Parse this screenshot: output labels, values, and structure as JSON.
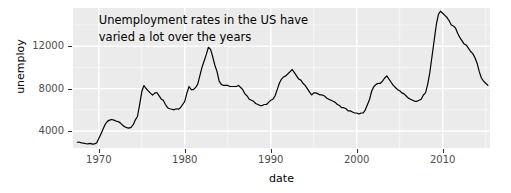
{
  "chart_data": {
    "type": "line",
    "title": "",
    "annotation": {
      "line1": "Unemployment rates in the US have",
      "line2": "varied a lot over the years",
      "x_value": 1970.0,
      "y_value": 14500
    },
    "xlabel": "date",
    "ylabel": "unemploy",
    "xlim": [
      1967.0,
      2015.5
    ],
    "ylim": [
      2400,
      15600
    ],
    "xticks": [
      1970,
      1980,
      1990,
      2000,
      2010
    ],
    "xticklabels": [
      "1970",
      "1980",
      "1990",
      "2000",
      "2010"
    ],
    "yticks": [
      4000,
      8000,
      12000
    ],
    "yticklabels": [
      "4000",
      "8000",
      "12000"
    ],
    "grid": true,
    "grid_major_color": "#ffffff",
    "grid_minor_color": "#ffffff",
    "panel_background": "#ebebeb",
    "line_color": "#000000",
    "line_width": 1.2,
    "legend": null,
    "series": [
      {
        "name": "unemploy",
        "x": [
          1967.5,
          1967.75,
          1968.0,
          1968.25,
          1968.5,
          1968.75,
          1969.0,
          1969.25,
          1969.5,
          1969.75,
          1970.0,
          1970.25,
          1970.5,
          1970.75,
          1971.0,
          1971.25,
          1971.5,
          1971.75,
          1972.0,
          1972.25,
          1972.5,
          1972.75,
          1973.0,
          1973.25,
          1973.5,
          1973.75,
          1974.0,
          1974.25,
          1974.5,
          1974.75,
          1975.0,
          1975.25,
          1975.5,
          1975.75,
          1976.0,
          1976.25,
          1976.5,
          1976.75,
          1977.0,
          1977.25,
          1977.5,
          1977.75,
          1978.0,
          1978.25,
          1978.5,
          1978.75,
          1979.0,
          1979.25,
          1979.5,
          1979.75,
          1980.0,
          1980.25,
          1980.5,
          1980.75,
          1981.0,
          1981.25,
          1981.5,
          1981.75,
          1982.0,
          1982.25,
          1982.5,
          1982.75,
          1983.0,
          1983.25,
          1983.5,
          1983.75,
          1984.0,
          1984.25,
          1984.5,
          1984.75,
          1985.0,
          1985.25,
          1985.5,
          1985.75,
          1986.0,
          1986.25,
          1986.5,
          1986.75,
          1987.0,
          1987.25,
          1987.5,
          1987.75,
          1988.0,
          1988.25,
          1988.5,
          1988.75,
          1989.0,
          1989.25,
          1989.5,
          1989.75,
          1990.0,
          1990.25,
          1990.5,
          1990.75,
          1991.0,
          1991.25,
          1991.5,
          1991.75,
          1992.0,
          1992.25,
          1992.5,
          1992.75,
          1993.0,
          1993.25,
          1993.5,
          1993.75,
          1994.0,
          1994.25,
          1994.5,
          1994.75,
          1995.0,
          1995.25,
          1995.5,
          1995.75,
          1996.0,
          1996.25,
          1996.5,
          1996.75,
          1997.0,
          1997.25,
          1997.5,
          1997.75,
          1998.0,
          1998.25,
          1998.5,
          1998.75,
          1999.0,
          1999.25,
          1999.5,
          1999.75,
          2000.0,
          2000.25,
          2000.5,
          2000.75,
          2001.0,
          2001.25,
          2001.5,
          2001.75,
          2002.0,
          2002.25,
          2002.5,
          2002.75,
          2003.0,
          2003.25,
          2003.5,
          2003.75,
          2004.0,
          2004.25,
          2004.5,
          2004.75,
          2005.0,
          2005.25,
          2005.5,
          2005.75,
          2006.0,
          2006.25,
          2006.5,
          2006.75,
          2007.0,
          2007.25,
          2007.5,
          2007.75,
          2008.0,
          2008.25,
          2008.5,
          2008.75,
          2009.0,
          2009.25,
          2009.5,
          2009.75,
          2010.0,
          2010.25,
          2010.5,
          2010.75,
          2011.0,
          2011.25,
          2011.5,
          2011.75,
          2012.0,
          2012.25,
          2012.5,
          2012.75,
          2013.0,
          2013.25,
          2013.5,
          2013.75,
          2014.0,
          2014.25,
          2014.5,
          2014.75,
          2015.0,
          2015.25
        ],
        "y": [
          2944,
          2945,
          2878,
          2858,
          2800,
          2790,
          2830,
          2760,
          2780,
          2880,
          3290,
          3730,
          4180,
          4640,
          4910,
          5030,
          5090,
          5030,
          4940,
          4890,
          4770,
          4560,
          4400,
          4320,
          4280,
          4350,
          4600,
          5050,
          5370,
          6480,
          7700,
          8290,
          8010,
          7790,
          7580,
          7380,
          7580,
          7630,
          7340,
          7030,
          6900,
          6500,
          6200,
          6100,
          6050,
          6000,
          6100,
          6060,
          6200,
          6500,
          6800,
          7600,
          8200,
          7900,
          7900,
          8100,
          8400,
          9200,
          10000,
          10600,
          11200,
          11900,
          11700,
          11000,
          10200,
          9600,
          8700,
          8400,
          8300,
          8300,
          8300,
          8200,
          8200,
          8200,
          8200,
          8300,
          8100,
          7900,
          7500,
          7300,
          7000,
          6900,
          6800,
          6600,
          6500,
          6400,
          6400,
          6500,
          6500,
          6700,
          6900,
          7000,
          7300,
          7900,
          8500,
          8900,
          9100,
          9200,
          9400,
          9600,
          9800,
          9500,
          9200,
          8900,
          8800,
          8500,
          8300,
          8000,
          7700,
          7400,
          7600,
          7600,
          7500,
          7400,
          7400,
          7300,
          7100,
          7000,
          6900,
          6800,
          6700,
          6500,
          6400,
          6200,
          6200,
          6100,
          5900,
          5900,
          5800,
          5700,
          5700,
          5600,
          5700,
          5700,
          6000,
          6500,
          7000,
          7800,
          8200,
          8400,
          8500,
          8500,
          8700,
          9000,
          9200,
          8900,
          8600,
          8300,
          8100,
          7900,
          7800,
          7600,
          7500,
          7300,
          7100,
          7000,
          6900,
          6800,
          6800,
          6900,
          7000,
          7400,
          7600,
          8400,
          9500,
          11000,
          12500,
          14000,
          15000,
          15300,
          15100,
          14900,
          14700,
          14400,
          14000,
          13900,
          13700,
          13200,
          12800,
          12500,
          12200,
          12100,
          11800,
          11500,
          11300,
          10900,
          10400,
          9600,
          9000,
          8700,
          8500,
          8300
        ]
      }
    ]
  },
  "axes": {
    "y_ticks": [
      {
        "label": "12000",
        "value": 12000
      },
      {
        "label": "8000",
        "value": 8000
      },
      {
        "label": "4000",
        "value": 4000
      }
    ],
    "x_ticks": [
      {
        "label": "1970",
        "value": 1970
      },
      {
        "label": "1980",
        "value": 1980
      },
      {
        "label": "1990",
        "value": 1990
      },
      {
        "label": "2000",
        "value": 2000
      },
      {
        "label": "2010",
        "value": 2010
      }
    ]
  }
}
